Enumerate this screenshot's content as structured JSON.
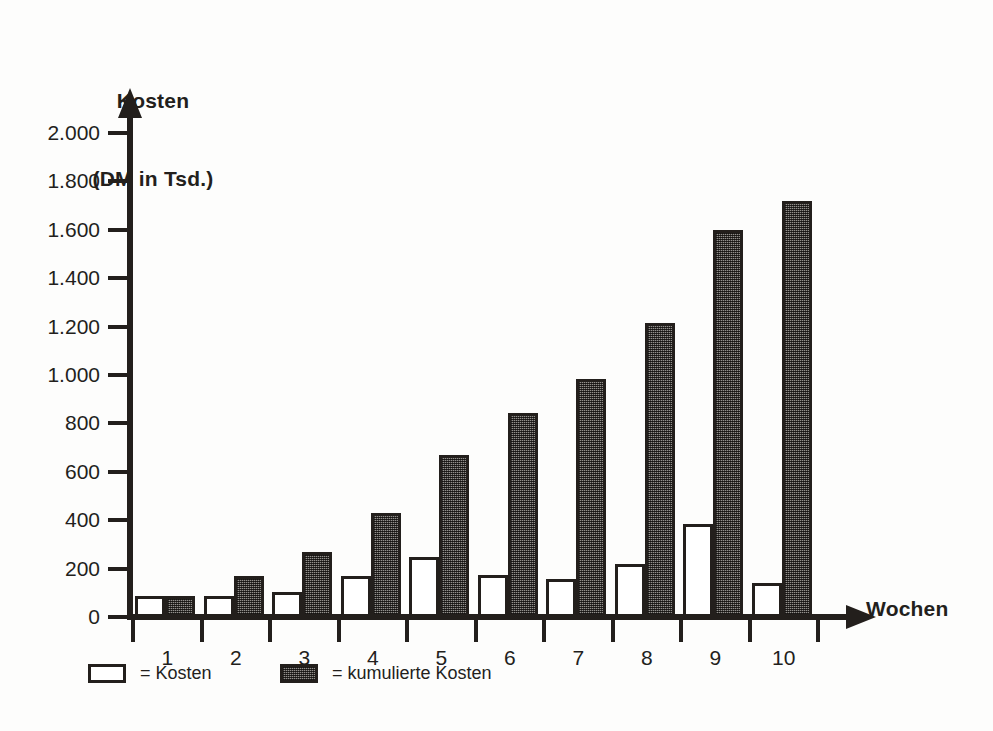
{
  "chart_data": {
    "type": "bar",
    "title": "",
    "ylabel": "Kosten\n(DM in Tsd.)",
    "ylabel_line1": "Kosten",
    "ylabel_line2": "(DM in Tsd.)",
    "xlabel": "Wochen",
    "categories": [
      "1",
      "2",
      "3",
      "4",
      "5",
      "6",
      "7",
      "8",
      "9",
      "10"
    ],
    "ylim": [
      0,
      2000
    ],
    "yticks": [
      0,
      200,
      400,
      600,
      800,
      1000,
      1200,
      1400,
      1600,
      1800,
      2000
    ],
    "ytick_labels": [
      "0",
      "200",
      "400",
      "600",
      "800",
      "1.000",
      "1.200",
      "1.400",
      "1.600",
      "1.800",
      "2.000"
    ],
    "grid": false,
    "legend_position": "bottom-left",
    "series": [
      {
        "name": "= Kosten",
        "key": "kosten",
        "color": "#ffffff",
        "values": [
          85,
          85,
          105,
          170,
          250,
          175,
          155,
          220,
          385,
          140
        ]
      },
      {
        "name": "= kumulierte Kosten",
        "key": "kumuliert",
        "color": "#6a6560",
        "values": [
          85,
          170,
          270,
          430,
          670,
          845,
          985,
          1215,
          1600,
          1720
        ]
      }
    ]
  },
  "legend": {
    "items": [
      {
        "label": "= Kosten",
        "swatch": "white"
      },
      {
        "label": "= kumulierte Kosten",
        "swatch": "gray"
      }
    ]
  },
  "colors": {
    "ink": "#231f1c",
    "bar_fill_white": "#ffffff",
    "bar_fill_hatched": "#6a6560",
    "background": "#fdfdfc"
  }
}
